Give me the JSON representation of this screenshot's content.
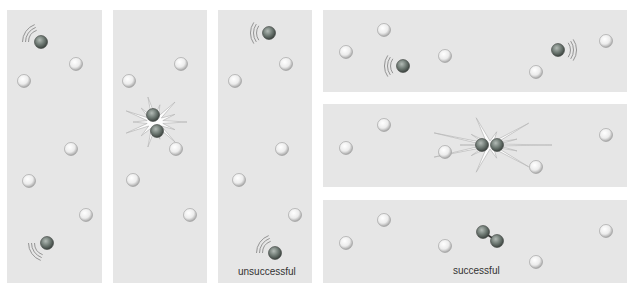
{
  "figure": {
    "colors": {
      "panel_bg": "#e6e6e6",
      "light_molecule": "#f2f2f2",
      "dark_molecule": "#6f7a74",
      "burst": "#ffffff",
      "caption": "#333333"
    },
    "panels": [
      {
        "id": "left-1",
        "x": 7,
        "y": 10,
        "w": 95,
        "h": 273,
        "light": [
          [
            76,
            64
          ],
          [
            24,
            81
          ],
          [
            71,
            149
          ],
          [
            29,
            181
          ],
          [
            86,
            215
          ]
        ],
        "dark": [
          {
            "x": 41,
            "y": 42,
            "trail": "up-left"
          },
          {
            "x": 47,
            "y": 243,
            "trail": "down-left"
          }
        ],
        "burst": null,
        "caption": ""
      },
      {
        "id": "left-2",
        "x": 113,
        "y": 10,
        "w": 94,
        "h": 273,
        "light": [
          [
            181,
            64
          ],
          [
            129,
            81
          ],
          [
            176,
            149
          ],
          [
            133,
            180
          ],
          [
            190,
            215
          ]
        ],
        "dark": [
          {
            "x": 153,
            "y": 115,
            "trail": "none"
          },
          {
            "x": 157,
            "y": 131,
            "trail": "none"
          }
        ],
        "burst": {
          "x": 155,
          "y": 122
        },
        "caption": ""
      },
      {
        "id": "left-3",
        "x": 218,
        "y": 10,
        "w": 94,
        "h": 273,
        "light": [
          [
            286,
            64
          ],
          [
            235,
            81
          ],
          [
            282,
            149
          ],
          [
            239,
            180
          ],
          [
            295,
            215
          ]
        ],
        "dark": [
          {
            "x": 269,
            "y": 33,
            "trail": "left"
          },
          {
            "x": 275,
            "y": 253,
            "trail": "up-left"
          }
        ],
        "burst": null,
        "caption": "unsuccessful"
      },
      {
        "id": "right-1",
        "x": 323,
        "y": 10,
        "w": 304,
        "h": 82,
        "light": [
          [
            384,
            30
          ],
          [
            346,
            52
          ],
          [
            445,
            56
          ],
          [
            536,
            72
          ],
          [
            606,
            41
          ]
        ],
        "dark": [
          {
            "x": 403,
            "y": 66,
            "trail": "left"
          },
          {
            "x": 558,
            "y": 50,
            "trail": "right"
          }
        ],
        "burst": null,
        "caption": ""
      },
      {
        "id": "right-2",
        "x": 323,
        "y": 104,
        "w": 304,
        "h": 83,
        "light": [
          [
            384,
            125
          ],
          [
            346,
            148
          ],
          [
            445,
            152
          ],
          [
            536,
            167
          ],
          [
            606,
            135
          ]
        ],
        "dark": [
          {
            "x": 482,
            "y": 145,
            "trail": "none"
          },
          {
            "x": 497,
            "y": 145,
            "trail": "none"
          }
        ],
        "burst": {
          "x": 490,
          "y": 145
        },
        "caption": ""
      },
      {
        "id": "right-3",
        "x": 323,
        "y": 200,
        "w": 304,
        "h": 83,
        "light": [
          [
            384,
            220
          ],
          [
            346,
            243
          ],
          [
            445,
            246
          ],
          [
            536,
            262
          ],
          [
            606,
            231
          ]
        ],
        "dark": [
          {
            "x": 483,
            "y": 232,
            "trail": "none"
          },
          {
            "x": 497,
            "y": 241,
            "trail": "none"
          }
        ],
        "bond": true,
        "burst": null,
        "caption": "successful"
      }
    ],
    "captions": {
      "unsuccessful": "unsuccessful",
      "successful": "successful"
    }
  }
}
